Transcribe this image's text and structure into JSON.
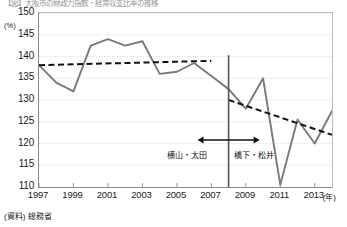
{
  "title_strip": "【図】大阪市の財政力指数・経常収支比率の推移",
  "source_note": "(資料) 総務省",
  "axis": {
    "y_unit": "(%)",
    "y_ticks": [
      150,
      145,
      140,
      135,
      130,
      125,
      120,
      115,
      110
    ],
    "x_unit": "(年)",
    "x_ticks": [
      1997,
      1999,
      2001,
      2003,
      2005,
      2007,
      2009,
      2011,
      2013
    ]
  },
  "annotations": {
    "era_left": "横山・太田",
    "era_right": "橋下・松井",
    "arrow": "double-headed-arrow",
    "divider_year": 2008
  },
  "colors": {
    "series_line": "#7a7a7a",
    "trend_line": "#111111",
    "divider": "#555555",
    "grid": "#cccccc",
    "axis": "#8a8a8a"
  },
  "chart_data": {
    "type": "line",
    "title": "【図】大阪市の財政力指数・経常収支比率の推移",
    "xlabel": "(年)",
    "ylabel": "(%)",
    "xlim": [
      1997,
      2014
    ],
    "ylim": [
      110,
      150
    ],
    "grid": true,
    "legend": "none",
    "x": [
      1997,
      1998,
      1999,
      2000,
      2001,
      2002,
      2003,
      2004,
      2005,
      2006,
      2007,
      2008,
      2009,
      2010,
      2011,
      2012,
      2013,
      2014
    ],
    "series": [
      {
        "name": "経常収支比率",
        "style": "solid",
        "color": "#7a7a7a",
        "values": [
          138.0,
          134.0,
          132.0,
          142.5,
          144.0,
          142.5,
          143.5,
          136.0,
          136.5,
          138.5,
          135.5,
          132.5,
          128.0,
          135.0,
          110.5,
          125.5,
          120.0,
          127.5
        ]
      },
      {
        "name": "前期トレンド",
        "style": "dashed",
        "color": "#111111",
        "x": [
          1997,
          2007
        ],
        "values": [
          138.0,
          139.0
        ]
      },
      {
        "name": "後期トレンド",
        "style": "dashed",
        "color": "#111111",
        "x": [
          2008,
          2014
        ],
        "values": [
          130.0,
          122.0
        ]
      }
    ],
    "markers": [
      {
        "type": "vline",
        "x": 2008,
        "label": "政権交代"
      },
      {
        "type": "span-arrow",
        "x0": 2006.2,
        "x1": 2009.8,
        "y": 120.8
      }
    ]
  }
}
